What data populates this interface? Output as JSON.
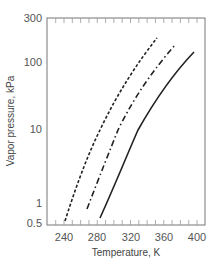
{
  "chart_data": {
    "type": "line",
    "title": "",
    "xlabel": "Temperature, K",
    "ylabel": "Vapor pressure, kPa",
    "xlim": [
      220,
      410
    ],
    "ylim": [
      0.5,
      300
    ],
    "yscale": "log",
    "grid": false,
    "legend": null,
    "x_ticks": [
      "240",
      "280",
      "320",
      "360",
      "400"
    ],
    "y_ticks": [
      "300",
      "100",
      "10",
      "1",
      "0.5"
    ],
    "series": [
      {
        "name": "dashed",
        "style": "dashed",
        "points": [
          [
            241,
            0.5
          ],
          [
            260,
            1.5
          ],
          [
            280,
            4.5
          ],
          [
            300,
            11
          ],
          [
            320,
            30
          ],
          [
            340,
            80
          ],
          [
            352,
            180
          ]
        ]
      },
      {
        "name": "dash-dot",
        "style": "dash-dot",
        "points": [
          [
            268,
            0.8
          ],
          [
            285,
            2.5
          ],
          [
            305,
            10
          ],
          [
            325,
            25
          ],
          [
            345,
            55
          ],
          [
            373,
            140
          ]
        ]
      },
      {
        "name": "solid",
        "style": "solid",
        "points": [
          [
            283,
            0.6
          ],
          [
            300,
            2
          ],
          [
            329,
            10
          ],
          [
            350,
            30
          ],
          [
            370,
            60
          ],
          [
            396,
            125
          ]
        ]
      }
    ]
  }
}
